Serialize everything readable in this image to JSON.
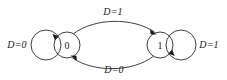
{
  "diagram": {
    "type": "finite-state-machine",
    "title": "",
    "canvas": {
      "width": 227,
      "height": 80,
      "background": "#ffffff"
    },
    "stroke_color": "#2b2b2b",
    "text_color": "#1a1a1a",
    "states": [
      {
        "id": "s0",
        "label": "0",
        "cx": 67,
        "cy": 45,
        "r": 13
      },
      {
        "id": "s1",
        "label": "1",
        "cx": 160,
        "cy": 45,
        "r": 13
      }
    ],
    "transitions": [
      {
        "id": "t-self-0",
        "from": "s0",
        "to": "s0",
        "label": "D=0",
        "label_x": 17,
        "label_y": 44,
        "kind": "self-loop",
        "side": "left"
      },
      {
        "id": "t-0-to-1",
        "from": "s0",
        "to": "s1",
        "label": "D=1",
        "label_x": 113,
        "label_y": 11,
        "kind": "arc",
        "side": "top"
      },
      {
        "id": "t-1-to-0",
        "from": "s1",
        "to": "s0",
        "label": "D=0",
        "label_x": 114,
        "label_y": 69,
        "kind": "arc",
        "side": "bottom"
      },
      {
        "id": "t-self-1",
        "from": "s1",
        "to": "s1",
        "label": "D=1",
        "label_x": 209,
        "label_y": 44,
        "kind": "self-loop",
        "side": "right"
      }
    ]
  }
}
